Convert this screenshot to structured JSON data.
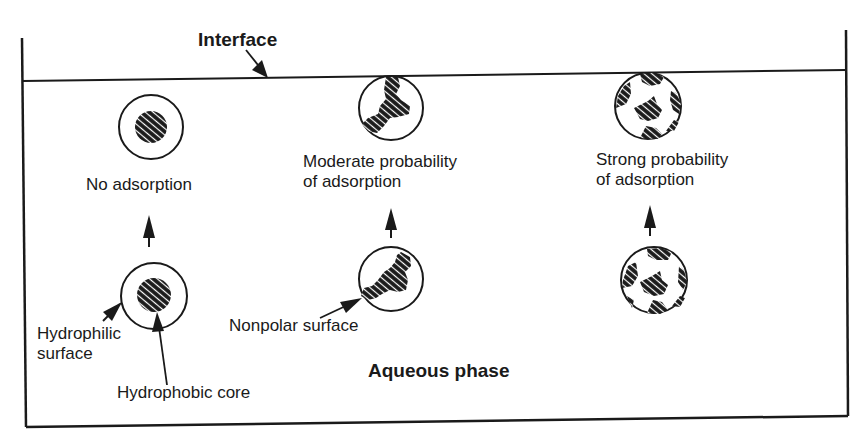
{
  "diagram": {
    "title_label": "Interface",
    "phase_label": "Aqueous phase",
    "colors": {
      "ink": "#1a1a1a",
      "background": "#ffffff"
    },
    "columns": [
      {
        "id": "hydrophilic",
        "top_caption": "No adsorption",
        "top_particle": "core-shell-particle-not-adsorbed",
        "bottom_particle": "core-shell-particle",
        "annotations": [
          "Hydrophilic\nsurface",
          "Hydrophobic core"
        ]
      },
      {
        "id": "partial-nonpolar",
        "top_caption": "Moderate probability\nof adsorption",
        "top_particle": "partially-nonpolar-particle-at-interface",
        "bottom_particle": "partially-nonpolar-particle",
        "annotations": [
          "Nonpolar surface"
        ]
      },
      {
        "id": "patchy-nonpolar",
        "top_caption": "Strong probability\nof adsorption",
        "top_particle": "patchy-nonpolar-particle-at-interface",
        "bottom_particle": "patchy-nonpolar-particle",
        "annotations": []
      }
    ]
  }
}
